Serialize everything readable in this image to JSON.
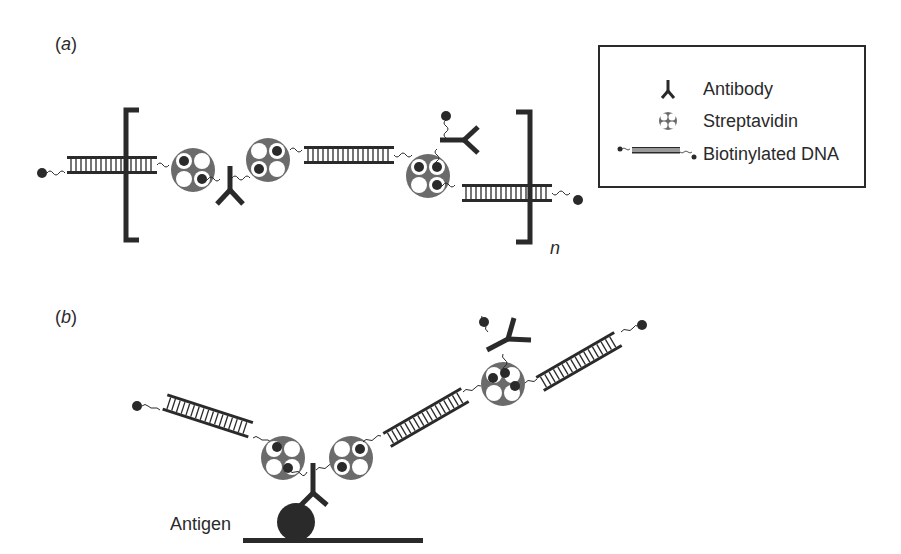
{
  "panels": {
    "a": {
      "label_open": "(",
      "letter": "a",
      "label_close": ")",
      "repeat_subscript": "n"
    },
    "b": {
      "label_open": "(",
      "letter": "b",
      "label_close": ")",
      "antigen_label": "Antigen"
    }
  },
  "legend": {
    "items": [
      {
        "icon": "antibody-icon",
        "label": "Antibody"
      },
      {
        "icon": "streptavidin-icon",
        "label": "Streptavidin"
      },
      {
        "icon": "biotinylated-dna-icon",
        "label": "Biotinylated DNA"
      }
    ]
  },
  "colors": {
    "ink": "#2a2a2a",
    "streptavidin": "#6b6b6b",
    "background": "#ffffff"
  }
}
